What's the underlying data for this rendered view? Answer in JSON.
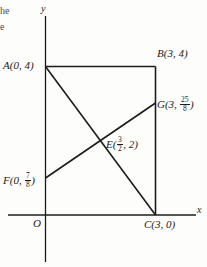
{
  "figure": {
    "type": "coordinate-geometry-diagram",
    "background_color": "#fdfdfb",
    "stroke_color": "#1c1c1c",
    "cropped_text_fragments": {
      "line1": "he",
      "line2": "e"
    },
    "axes": {
      "x_label": "x",
      "y_label": "y",
      "origin_label": "O"
    },
    "points": {
      "A": {
        "name": "A",
        "label": "A(0, 4)",
        "x": 0,
        "y": 4
      },
      "B": {
        "name": "B",
        "label": "B(3, 4)",
        "x": 3,
        "y": 4
      },
      "C": {
        "name": "C",
        "label": "C(3, 0)",
        "x": 3,
        "y": 0
      },
      "E": {
        "name": "E",
        "label_prefix": "E(",
        "x_num": "3",
        "x_den": "2",
        "label_suffix": ", 2)",
        "x": 1.5,
        "y": 2
      },
      "F": {
        "name": "F",
        "label_prefix": "F(0, ",
        "y_num": "7",
        "y_den": "8",
        "label_suffix": ")",
        "x": 0,
        "y": 0.875
      },
      "G": {
        "name": "G",
        "label_prefix": "G(3, ",
        "y_num": "25",
        "y_den": "8",
        "label_suffix": ")",
        "x": 3,
        "y": 3.125
      }
    },
    "segments": [
      {
        "name": "AB",
        "from": "A",
        "to": "B"
      },
      {
        "name": "BC",
        "from": "B",
        "to": "C"
      },
      {
        "name": "AC",
        "from": "A",
        "to": "C"
      },
      {
        "name": "FG",
        "from": "F",
        "to": "G"
      }
    ]
  }
}
